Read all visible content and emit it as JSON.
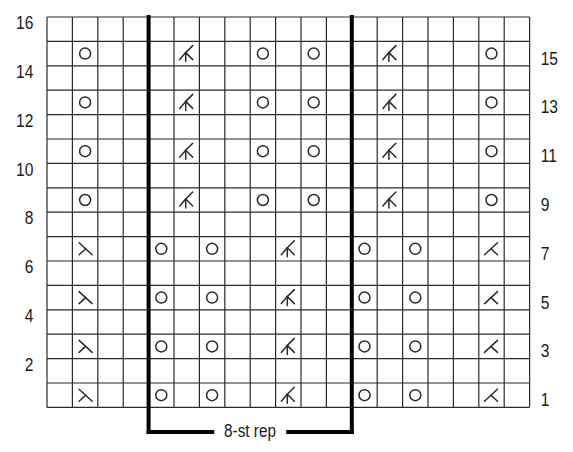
{
  "chart_title": "",
  "grid": {
    "columns": 19,
    "rows": 16,
    "origin_x": 47,
    "origin_y": 17,
    "cell_width": 25.4,
    "cell_height": 24.4,
    "line_color": "#2a2a2a",
    "thick_line_color": "#000000"
  },
  "repeat": {
    "label": "8-st rep",
    "start_col": 4,
    "end_col": 12
  },
  "row_labels": {
    "left": [
      {
        "row": 16,
        "text": "16"
      },
      {
        "row": 14,
        "text": "14"
      },
      {
        "row": 12,
        "text": "12"
      },
      {
        "row": 10,
        "text": "10"
      },
      {
        "row": 8,
        "text": "8"
      },
      {
        "row": 6,
        "text": "6"
      },
      {
        "row": 4,
        "text": "4"
      },
      {
        "row": 2,
        "text": "2"
      }
    ],
    "right": [
      {
        "row": 15,
        "text": "15"
      },
      {
        "row": 13,
        "text": "13"
      },
      {
        "row": 11,
        "text": "11"
      },
      {
        "row": 9,
        "text": "9"
      },
      {
        "row": 7,
        "text": "7"
      },
      {
        "row": 5,
        "text": "5"
      },
      {
        "row": 3,
        "text": "3"
      },
      {
        "row": 1,
        "text": "1"
      }
    ]
  },
  "symbols": {
    "yo": "yarn-over-circle",
    "ssk": "ssk-decrease",
    "k2tog": "k2tog-decrease",
    "dbl": "double-decrease"
  },
  "chart_rows": [
    {
      "row": 1,
      "cells": [
        {
          "col": 1,
          "sym": "ssk"
        },
        {
          "col": 4,
          "sym": "yo"
        },
        {
          "col": 6,
          "sym": "yo"
        },
        {
          "col": 9,
          "sym": "dbl"
        },
        {
          "col": 12,
          "sym": "yo"
        },
        {
          "col": 14,
          "sym": "yo"
        },
        {
          "col": 17,
          "sym": "k2tog"
        }
      ]
    },
    {
      "row": 3,
      "cells": [
        {
          "col": 1,
          "sym": "ssk"
        },
        {
          "col": 4,
          "sym": "yo"
        },
        {
          "col": 6,
          "sym": "yo"
        },
        {
          "col": 9,
          "sym": "dbl"
        },
        {
          "col": 12,
          "sym": "yo"
        },
        {
          "col": 14,
          "sym": "yo"
        },
        {
          "col": 17,
          "sym": "k2tog"
        }
      ]
    },
    {
      "row": 5,
      "cells": [
        {
          "col": 1,
          "sym": "ssk"
        },
        {
          "col": 4,
          "sym": "yo"
        },
        {
          "col": 6,
          "sym": "yo"
        },
        {
          "col": 9,
          "sym": "dbl"
        },
        {
          "col": 12,
          "sym": "yo"
        },
        {
          "col": 14,
          "sym": "yo"
        },
        {
          "col": 17,
          "sym": "k2tog"
        }
      ]
    },
    {
      "row": 7,
      "cells": [
        {
          "col": 1,
          "sym": "ssk"
        },
        {
          "col": 4,
          "sym": "yo"
        },
        {
          "col": 6,
          "sym": "yo"
        },
        {
          "col": 9,
          "sym": "dbl"
        },
        {
          "col": 12,
          "sym": "yo"
        },
        {
          "col": 14,
          "sym": "yo"
        },
        {
          "col": 17,
          "sym": "k2tog"
        }
      ]
    },
    {
      "row": 9,
      "cells": [
        {
          "col": 1,
          "sym": "yo"
        },
        {
          "col": 5,
          "sym": "dbl"
        },
        {
          "col": 8,
          "sym": "yo"
        },
        {
          "col": 10,
          "sym": "yo"
        },
        {
          "col": 13,
          "sym": "dbl"
        },
        {
          "col": 17,
          "sym": "yo"
        }
      ]
    },
    {
      "row": 11,
      "cells": [
        {
          "col": 1,
          "sym": "yo"
        },
        {
          "col": 5,
          "sym": "dbl"
        },
        {
          "col": 8,
          "sym": "yo"
        },
        {
          "col": 10,
          "sym": "yo"
        },
        {
          "col": 13,
          "sym": "dbl"
        },
        {
          "col": 17,
          "sym": "yo"
        }
      ]
    },
    {
      "row": 13,
      "cells": [
        {
          "col": 1,
          "sym": "yo"
        },
        {
          "col": 5,
          "sym": "dbl"
        },
        {
          "col": 8,
          "sym": "yo"
        },
        {
          "col": 10,
          "sym": "yo"
        },
        {
          "col": 13,
          "sym": "dbl"
        },
        {
          "col": 17,
          "sym": "yo"
        }
      ]
    },
    {
      "row": 15,
      "cells": [
        {
          "col": 1,
          "sym": "yo"
        },
        {
          "col": 5,
          "sym": "dbl"
        },
        {
          "col": 8,
          "sym": "yo"
        },
        {
          "col": 10,
          "sym": "yo"
        },
        {
          "col": 13,
          "sym": "dbl"
        },
        {
          "col": 17,
          "sym": "yo"
        }
      ]
    }
  ]
}
